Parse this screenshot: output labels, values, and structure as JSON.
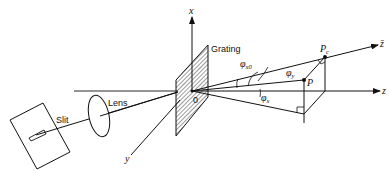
{
  "diagram": {
    "type": "optical-geometry",
    "labels": {
      "slit": "Slit",
      "lens": "Lens",
      "grating": "Grating",
      "origin": "0",
      "x_axis": "x",
      "y_axis": "y",
      "z_axis": "z",
      "z_bar_axis": "z̄",
      "point_p": "P",
      "point_pc": "P",
      "point_pc_sub": "c",
      "phi_x0": "φ",
      "phi_x0_sub": "x0",
      "phi_y": "φ",
      "phi_y_sub": "y",
      "phi_x": "φ",
      "phi_x_sub": "x"
    },
    "colors": {
      "line": "#111111",
      "background": "#ffffff"
    }
  }
}
